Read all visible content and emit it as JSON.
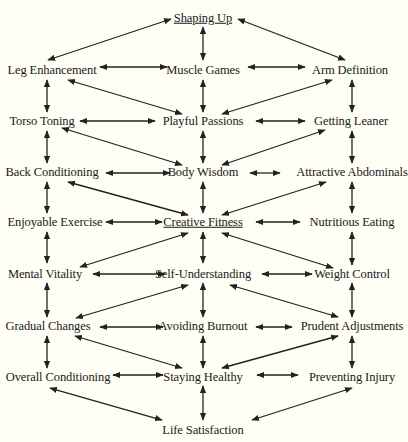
{
  "diagram": {
    "title": "Creative Fitness",
    "background": "#fefef4",
    "line_color": "#222222",
    "nodes": [
      {
        "id": "shaping_up",
        "label": "Shaping Up",
        "x": 203,
        "y": 18,
        "underline": true
      },
      {
        "id": "leg_enhancement",
        "label": "Leg Enhancement",
        "x": 52,
        "y": 70
      },
      {
        "id": "muscle_games",
        "label": "Muscle Games",
        "x": 203,
        "y": 70
      },
      {
        "id": "arm_definition",
        "label": "Arm Definition",
        "x": 350,
        "y": 70
      },
      {
        "id": "torso_toning",
        "label": "Torso Toning",
        "x": 42,
        "y": 121
      },
      {
        "id": "playful_passions",
        "label": "Playful Passions",
        "x": 203,
        "y": 121
      },
      {
        "id": "getting_leaner",
        "label": "Getting Leaner",
        "x": 351,
        "y": 121
      },
      {
        "id": "back_conditioning",
        "label": "Back Conditioning",
        "x": 52,
        "y": 172
      },
      {
        "id": "body_wisdom",
        "label": "Body Wisdom",
        "x": 203,
        "y": 172
      },
      {
        "id": "attractive_abdominals",
        "label": "Attractive Abdominals",
        "x": 352,
        "y": 172
      },
      {
        "id": "enjoyable_exercise",
        "label": "Enjoyable Exercise",
        "x": 55,
        "y": 222
      },
      {
        "id": "creative_fitness",
        "label": "Creative Fitness",
        "x": 203,
        "y": 222,
        "underline": true
      },
      {
        "id": "nutritious_eating",
        "label": "Nutritious Eating",
        "x": 352,
        "y": 222
      },
      {
        "id": "mental_vitality",
        "label": "Mental Vitality",
        "x": 45,
        "y": 274
      },
      {
        "id": "self_understanding",
        "label": "Self-Understanding",
        "x": 203,
        "y": 274
      },
      {
        "id": "weight_control",
        "label": "Weight Control",
        "x": 352,
        "y": 274
      },
      {
        "id": "gradual_changes",
        "label": "Gradual Changes",
        "x": 48,
        "y": 326
      },
      {
        "id": "avoiding_burnout",
        "label": "Avoiding Burnout",
        "x": 203,
        "y": 326
      },
      {
        "id": "prudent_adjustments",
        "label": "Prudent Adjustments",
        "x": 352,
        "y": 326
      },
      {
        "id": "overall_conditioning",
        "label": "Overall Conditioning",
        "x": 58,
        "y": 377
      },
      {
        "id": "staying_healthy",
        "label": "Staying Healthy",
        "x": 203,
        "y": 377
      },
      {
        "id": "preventing_injury",
        "label": "Preventing Injury",
        "x": 352,
        "y": 377
      },
      {
        "id": "life_satisfaction",
        "label": "Life Satisfaction",
        "x": 203,
        "y": 430
      }
    ],
    "edges": [
      [
        [
          "shaping_up",
          "leg_enhancement"
        ],
        [
          171,
          19,
          48,
          60
        ]
      ],
      [
        [
          "shaping_up",
          "arm_definition"
        ],
        [
          238,
          19,
          345,
          60
        ]
      ],
      [
        [
          "shaping_up",
          "muscle_games"
        ],
        [
          203,
          27,
          203,
          60
        ]
      ],
      [
        [
          "leg_enhancement",
          "muscle_games"
        ],
        [
          100,
          67,
          167,
          67
        ]
      ],
      [
        [
          "muscle_games",
          "arm_definition"
        ],
        [
          248,
          67,
          305,
          67
        ]
      ],
      [
        [
          "leg_enhancement",
          "torso_toning"
        ],
        [
          47,
          80,
          47,
          112
        ]
      ],
      [
        [
          "muscle_games",
          "playful_passions"
        ],
        [
          203,
          80,
          203,
          112
        ]
      ],
      [
        [
          "arm_definition",
          "getting_leaner"
        ],
        [
          352,
          80,
          352,
          112
        ]
      ],
      [
        [
          "leg_enhancement",
          "playful_passions"
        ],
        [
          68,
          80,
          182,
          114
        ]
      ],
      [
        [
          "arm_definition",
          "playful_passions"
        ],
        [
          332,
          80,
          222,
          114
        ]
      ],
      [
        [
          "torso_toning",
          "playful_passions"
        ],
        [
          80,
          121,
          155,
          121
        ]
      ],
      [
        [
          "playful_passions",
          "getting_leaner"
        ],
        [
          256,
          121,
          305,
          121
        ]
      ],
      [
        [
          "torso_toning",
          "back_conditioning"
        ],
        [
          47,
          131,
          47,
          163
        ]
      ],
      [
        [
          "playful_passions",
          "body_wisdom"
        ],
        [
          203,
          131,
          203,
          163
        ]
      ],
      [
        [
          "getting_leaner",
          "attractive_abdominals"
        ],
        [
          352,
          131,
          352,
          163
        ]
      ],
      [
        [
          "torso_toning",
          "body_wisdom"
        ],
        [
          62,
          128,
          182,
          165
        ]
      ],
      [
        [
          "getting_leaner",
          "body_wisdom"
        ],
        [
          325,
          130,
          222,
          165
        ]
      ],
      [
        [
          "back_conditioning",
          "body_wisdom"
        ],
        [
          106,
          173,
          170,
          173
        ]
      ],
      [
        [
          "body_wisdom",
          "attractive_abdominals"
        ],
        [
          250,
          173,
          280,
          173
        ]
      ],
      [
        [
          "back_conditioning",
          "enjoyable_exercise"
        ],
        [
          47,
          182,
          47,
          213
        ]
      ],
      [
        [
          "body_wisdom",
          "creative_fitness"
        ],
        [
          203,
          182,
          203,
          213
        ]
      ],
      [
        [
          "attractive_abdominals",
          "nutritious_eating"
        ],
        [
          352,
          182,
          352,
          213
        ]
      ],
      [
        [
          "back_conditioning",
          "creative_fitness"
        ],
        [
          68,
          182,
          188,
          215
        ]
      ],
      [
        [
          "attractive_abdominals",
          "creative_fitness"
        ],
        [
          326,
          182,
          222,
          215
        ]
      ],
      [
        [
          "enjoyable_exercise",
          "creative_fitness"
        ],
        [
          106,
          222,
          162,
          222
        ]
      ],
      [
        [
          "creative_fitness",
          "nutritious_eating"
        ],
        [
          256,
          222,
          300,
          222
        ]
      ],
      [
        [
          "enjoyable_exercise",
          "mental_vitality"
        ],
        [
          47,
          232,
          47,
          263
        ]
      ],
      [
        [
          "creative_fitness",
          "self_understanding"
        ],
        [
          203,
          232,
          203,
          263
        ]
      ],
      [
        [
          "nutritious_eating",
          "weight_control"
        ],
        [
          352,
          232,
          352,
          265
        ]
      ],
      [
        [
          "mental_vitality",
          "creative_fitness"
        ],
        [
          80,
          267,
          188,
          233
        ]
      ],
      [
        [
          "creative_fitness",
          "weight_control"
        ],
        [
          222,
          233,
          333,
          268
        ]
      ],
      [
        [
          "mental_vitality",
          "self_understanding"
        ],
        [
          93,
          274,
          165,
          274
        ]
      ],
      [
        [
          "self_understanding",
          "weight_control"
        ],
        [
          262,
          274,
          312,
          274
        ]
      ],
      [
        [
          "mental_vitality",
          "gradual_changes"
        ],
        [
          47,
          283,
          47,
          317
        ]
      ],
      [
        [
          "self_understanding",
          "avoiding_burnout"
        ],
        [
          203,
          283,
          203,
          317
        ]
      ],
      [
        [
          "weight_control",
          "prudent_adjustments"
        ],
        [
          352,
          283,
          352,
          317
        ]
      ],
      [
        [
          "gradual_changes",
          "self_understanding"
        ],
        [
          76,
          318,
          188,
          285
        ]
      ],
      [
        [
          "self_understanding",
          "prudent_adjustments"
        ],
        [
          230,
          285,
          338,
          317
        ]
      ],
      [
        [
          "gradual_changes",
          "avoiding_burnout"
        ],
        [
          100,
          327,
          163,
          327
        ]
      ],
      [
        [
          "avoiding_burnout",
          "prudent_adjustments"
        ],
        [
          256,
          327,
          292,
          327
        ]
      ],
      [
        [
          "gradual_changes",
          "overall_conditioning"
        ],
        [
          47,
          336,
          47,
          368
        ]
      ],
      [
        [
          "avoiding_burnout",
          "staying_healthy"
        ],
        [
          203,
          336,
          203,
          368
        ]
      ],
      [
        [
          "prudent_adjustments",
          "preventing_injury"
        ],
        [
          352,
          336,
          352,
          368
        ]
      ],
      [
        [
          "gradual_changes",
          "staying_healthy"
        ],
        [
          75,
          336,
          182,
          368
        ]
      ],
      [
        [
          "prudent_adjustments",
          "staying_healthy"
        ],
        [
          338,
          336,
          222,
          368
        ]
      ],
      [
        [
          "overall_conditioning",
          "staying_healthy"
        ],
        [
          113,
          375,
          163,
          375
        ]
      ],
      [
        [
          "staying_healthy",
          "preventing_injury"
        ],
        [
          257,
          375,
          298,
          375
        ]
      ],
      [
        [
          "staying_healthy",
          "life_satisfaction"
        ],
        [
          203,
          386,
          203,
          420
        ]
      ],
      [
        [
          "overall_conditioning",
          "life_satisfaction"
        ],
        [
          50,
          388,
          162,
          420
        ]
      ],
      [
        [
          "preventing_injury",
          "life_satisfaction"
        ],
        [
          352,
          388,
          252,
          420
        ]
      ]
    ]
  }
}
